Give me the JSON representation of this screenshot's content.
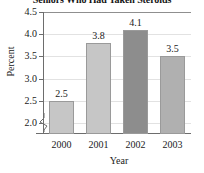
{
  "chart_data": {
    "type": "bar",
    "title": "Seniors Who Had Taken Steroids",
    "xlabel": "Year",
    "ylabel": "Percent",
    "categories": [
      "2000",
      "2001",
      "2002",
      "2003"
    ],
    "values": [
      2.5,
      3.8,
      4.1,
      3.5
    ],
    "value_labels": [
      "2.5",
      "3.8",
      "4.1",
      "3.5"
    ],
    "ylim": [
      1.75,
      4.5
    ],
    "yticks": [
      2.0,
      2.5,
      3.0,
      3.5,
      4.0,
      4.5
    ],
    "ytick_labels": [
      "2.0",
      "2.5",
      "3.0",
      "3.5",
      "4.0",
      "4.5"
    ],
    "grid": true,
    "legend": false,
    "axis_break": true,
    "bar_colors": [
      "#c6c6c6",
      "#c6c6c6",
      "#8d8d8d",
      "#b0b0b0"
    ],
    "colors": {
      "bar_light": "#c6c6c6",
      "bar_mid": "#b0b0b0",
      "bar_dark": "#8d8d8d",
      "axis": "#6d6d6d",
      "grid": "#e2e2e2",
      "text": "#1a1a1a",
      "background": "#ffffff"
    }
  }
}
